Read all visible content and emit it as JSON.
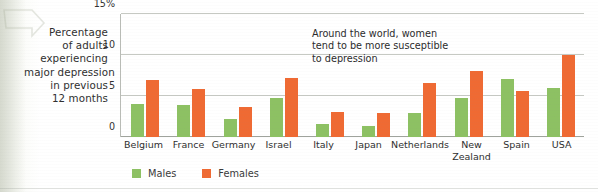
{
  "caption": {
    "lines": [
      "Percentage",
      "of adults",
      "experiencing",
      "major depression",
      "in previous",
      "12 months"
    ]
  },
  "legend": {
    "items": [
      {
        "label": "Males",
        "color": "#8dc163",
        "swatch": "male-swatch"
      },
      {
        "label": "Females",
        "color": "#ef6a33",
        "swatch": "female-swatch"
      }
    ]
  },
  "annotation": {
    "lines": [
      "Around the world, women",
      "tend to be more susceptible",
      "to depression"
    ]
  },
  "axis": {
    "ticks": [
      {
        "label": "15%",
        "value": 15
      },
      {
        "label": "10",
        "value": 10
      },
      {
        "label": "5",
        "value": 5
      },
      {
        "label": "0",
        "value": 0
      }
    ]
  },
  "chart_data": {
    "type": "bar",
    "title": "Percentage of adults experiencing major depression in previous 12 months",
    "xlabel": "",
    "ylabel": "Percentage of adults experiencing major depression in previous 12 months",
    "ylim": [
      0,
      15
    ],
    "yticks": [
      0,
      5,
      10,
      15
    ],
    "ytick_labels": [
      "0",
      "5",
      "10",
      "15%"
    ],
    "grid": true,
    "legend_position": "bottom",
    "categories": [
      "Belgium",
      "France",
      "Germany",
      "Israel",
      "Italy",
      "Japan",
      "Netherlands",
      "New Zealand",
      "Spain",
      "USA"
    ],
    "category_lines": [
      [
        "Belgium"
      ],
      [
        "France"
      ],
      [
        "Germany"
      ],
      [
        "Israel"
      ],
      [
        "Italy"
      ],
      [
        "Japan"
      ],
      [
        "Netherlands"
      ],
      [
        "New",
        "Zealand"
      ],
      [
        "Spain"
      ],
      [
        "USA"
      ]
    ],
    "series": [
      {
        "name": "Males",
        "color": "#8dc163",
        "values": [
          4.0,
          3.9,
          2.2,
          4.7,
          1.6,
          1.4,
          2.9,
          4.8,
          7.1,
          6.0
        ]
      },
      {
        "name": "Females",
        "color": "#ef6a33",
        "values": [
          7.0,
          5.9,
          3.7,
          7.2,
          3.1,
          2.9,
          6.6,
          8.0,
          5.6,
          10.0
        ]
      }
    ],
    "annotations": [
      {
        "text": "Around the world, women tend to be more susceptible to depression",
        "x": "Italy",
        "y": 14
      }
    ]
  },
  "colors": {
    "male": "#8dc163",
    "female": "#ef6a33",
    "grid": "#c6c9c3",
    "axis": "#9fa39c",
    "text": "#2e2e2e",
    "page": "#ffffff"
  }
}
